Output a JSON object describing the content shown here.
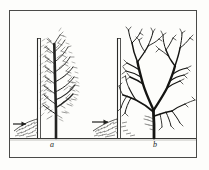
{
  "figure": {
    "kind": "line-drawing",
    "medium": "scanned book engraving",
    "background_color": "#fdfdfb",
    "ink_color": "#1b1b1b",
    "frame": {
      "name": "figure-border",
      "stroke": "#4a4a48",
      "x": 9,
      "y": 10,
      "width": 188,
      "height": 148
    },
    "ground_line": {
      "name": "ground-line",
      "y": 138,
      "x_start": 10,
      "x_end": 196,
      "stroke": "#3a3a38"
    },
    "panels": [
      {
        "id": "a",
        "label": "a",
        "label_x": 50,
        "label_y": 141,
        "description": "dense twiggy crown, many fine shoots, narrow spread",
        "wall": {
          "name": "shelter-wall-a",
          "x": 37,
          "top_y": 38,
          "bottom_y": 138,
          "thickness": 3
        },
        "trunk_x": 56,
        "arrow": {
          "name": "wind-arrow-a",
          "x_tail": 13,
          "x_head": 26,
          "y": 124
        },
        "debris_mound": {
          "name": "debris-mound-a",
          "x_start": 14,
          "x_end": 38,
          "peak_y": 120
        }
      },
      {
        "id": "b",
        "label": "b",
        "label_x": 155,
        "label_y": 141,
        "description": "open coarse crown, few heavy limbs, wide spread",
        "wall": {
          "name": "shelter-wall-b",
          "x": 117,
          "top_y": 38,
          "bottom_y": 138,
          "thickness": 3
        },
        "trunk_x": 154,
        "arrow": {
          "name": "wind-arrow-b",
          "x_tail": 92,
          "x_head": 108,
          "y": 122
        },
        "debris_mound": {
          "name": "debris-mound-b",
          "x_start": 93,
          "x_end": 118,
          "peak_y": 119
        }
      }
    ]
  }
}
